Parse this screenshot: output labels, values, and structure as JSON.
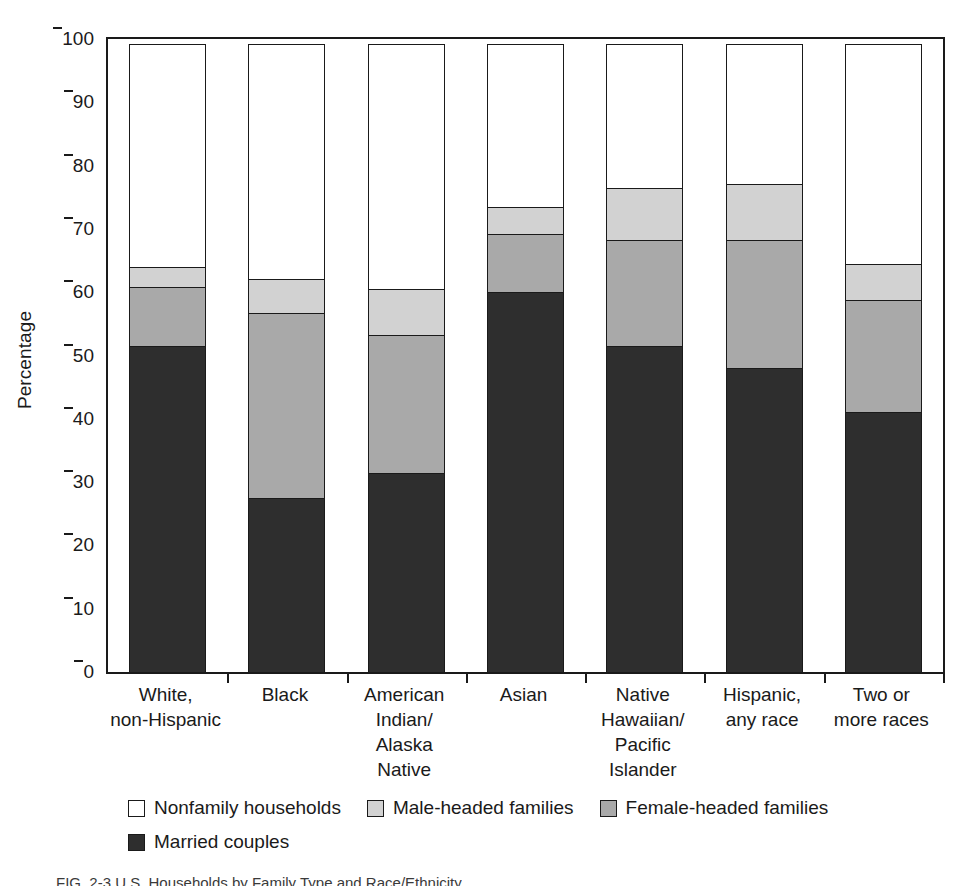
{
  "chart_data": {
    "type": "bar",
    "subtype": "stacked-bar-100-percent",
    "title": "",
    "xlabel": "",
    "ylabel": "Percentage",
    "ylim": [
      0,
      100
    ],
    "yticks": [
      0,
      10,
      20,
      30,
      40,
      50,
      60,
      70,
      80,
      90,
      100
    ],
    "grid": false,
    "legend_position": "bottom",
    "categories": [
      "White,\nnon-Hispanic",
      "Black",
      "American\nIndian/\nAlaska\nNative",
      "Asian",
      "Native\nHawaiian/\nPacific\nIslander",
      "Hispanic,\nany race",
      "Two or\nmore races"
    ],
    "series": [
      {
        "name": "Married couples",
        "color": "#2e2e2e",
        "values": [
          51.5,
          27.5,
          31.5,
          60.0,
          51.5,
          48.0,
          41.0
        ]
      },
      {
        "name": "Female-headed families",
        "color": "#a9a9a9",
        "values": [
          9.5,
          29.5,
          22.0,
          9.5,
          17.0,
          20.5,
          18.0
        ]
      },
      {
        "name": "Male-headed families",
        "color": "#d2d2d2",
        "values": [
          3.5,
          5.5,
          7.5,
          4.5,
          8.5,
          9.0,
          6.0
        ]
      },
      {
        "name": "Nonfamily households",
        "color": "#ffffff",
        "values": [
          35.5,
          37.5,
          39.0,
          26.0,
          23.0,
          22.5,
          35.0
        ]
      }
    ],
    "cumulative_tops": {
      "married": [
        51.5,
        27.5,
        31.5,
        60.0,
        51.5,
        48.0,
        41.0
      ],
      "female": [
        61.0,
        57.0,
        53.5,
        69.5,
        68.5,
        68.5,
        59.0
      ],
      "male": [
        64.5,
        62.5,
        61.0,
        74.0,
        77.0,
        77.5,
        65.0
      ],
      "nonfamily": [
        100,
        100,
        100,
        100,
        100,
        100,
        100
      ]
    }
  },
  "axis": {
    "ylabel": "Percentage",
    "tick_labels": [
      "100",
      "90",
      "80",
      "70",
      "60",
      "50",
      "40",
      "30",
      "20",
      "10",
      "0"
    ]
  },
  "legend": {
    "row1": [
      {
        "label": "Nonfamily households",
        "swatch": "sw-nonfamily"
      },
      {
        "label": "Male-headed families",
        "swatch": "sw-male"
      },
      {
        "label": "Female-headed families",
        "swatch": "sw-female"
      }
    ],
    "row2": [
      {
        "label": "Married couples",
        "swatch": "sw-married"
      }
    ]
  },
  "caption": {
    "text": "FIG. 2-3  U.S. Households by Family Type and Race/Ethnicity"
  }
}
